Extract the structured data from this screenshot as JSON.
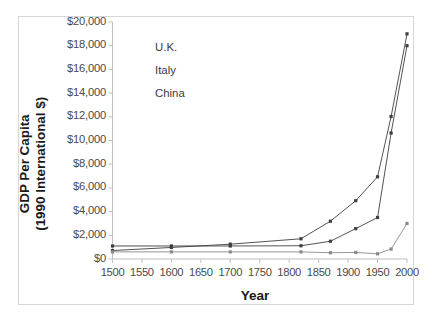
{
  "chart_data": {
    "type": "line",
    "title": "",
    "xlabel": "Year",
    "ylabel": "GDP Per Capita\n(1990 International $)",
    "ylabel_line1": "GDP Per Capita",
    "ylabel_line2": "(1990 International $)",
    "xlim": [
      1500,
      2000
    ],
    "ylim": [
      0,
      20000
    ],
    "xticks": [
      1500,
      1550,
      1600,
      1650,
      1700,
      1750,
      1800,
      1850,
      1900,
      1950,
      2000
    ],
    "xtick_labels": [
      "1500",
      "1550",
      "1600",
      "1650",
      "1700",
      "1750",
      "1800",
      "1850",
      "1900",
      "1950",
      "2000"
    ],
    "yticks": [
      0,
      2000,
      4000,
      6000,
      8000,
      10000,
      12000,
      14000,
      16000,
      18000,
      20000
    ],
    "ytick_labels": [
      "$0",
      "$2,000",
      "$4,000",
      "$6,000",
      "$8,000",
      "$10,000",
      "$12,000",
      "$14,000",
      "$16,000",
      "$18,000",
      "$20,000"
    ],
    "grid": false,
    "legend_position": "top-left-inside",
    "series": [
      {
        "name": "U.K.",
        "color": "#3f3f3f",
        "x": [
          1500,
          1600,
          1700,
          1820,
          1870,
          1913,
          1950,
          1973,
          2000
        ],
        "values": [
          714,
          974,
          1250,
          1706,
          3190,
          4921,
          6939,
          12025,
          19000
        ]
      },
      {
        "name": "Italy",
        "color": "#3f3f3f",
        "x": [
          1500,
          1600,
          1700,
          1820,
          1870,
          1913,
          1950,
          1973,
          2000
        ],
        "values": [
          1100,
          1100,
          1100,
          1117,
          1499,
          2564,
          3502,
          10634,
          18000
        ]
      },
      {
        "name": "China",
        "color": "#8a8a8a",
        "x": [
          1500,
          1600,
          1700,
          1820,
          1870,
          1913,
          1950,
          1973,
          2000
        ],
        "values": [
          600,
          600,
          600,
          600,
          530,
          552,
          439,
          839,
          3000
        ]
      }
    ]
  },
  "legend": {
    "items": [
      {
        "label": "U.K."
      },
      {
        "label": "Italy"
      },
      {
        "label": "China"
      }
    ]
  }
}
